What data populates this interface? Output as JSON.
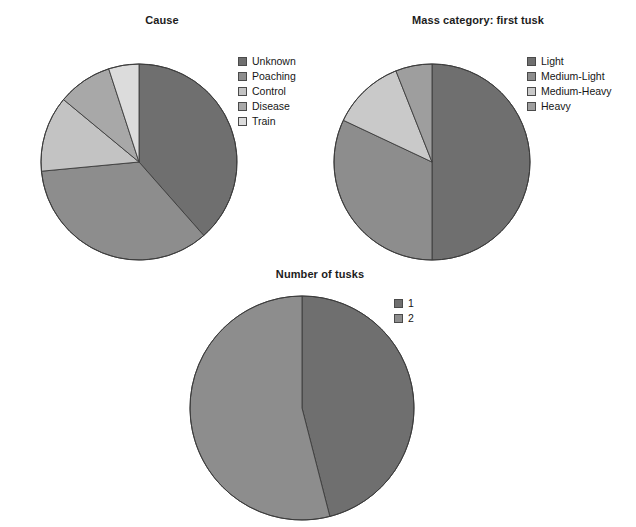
{
  "figure": {
    "background": "#ffffff",
    "width": 636,
    "height": 527
  },
  "palette": {
    "dark_gray": "#6f6f6f",
    "medium_gray": "#8d8d8d",
    "light_gray": "#c3c3c3",
    "lighter_gray": "#a8a8a8",
    "lightest_gray": "#dcdcdc",
    "outline": "#3c3c3c"
  },
  "chart_data": [
    {
      "type": "pie",
      "id": "cause",
      "title": "Cause",
      "legend_position": "right",
      "start_angle_deg": 0,
      "direction": "clockwise",
      "categories": [
        "Unknown",
        "Poaching",
        "Control",
        "Disease",
        "Train"
      ],
      "values": [
        38.5,
        35.0,
        12.5,
        9.0,
        5.0
      ],
      "unit": "percent",
      "colors": [
        "#6f6f6f",
        "#8d8d8d",
        "#c3c3c3",
        "#a8a8a8",
        "#dcdcdc"
      ]
    },
    {
      "type": "pie",
      "id": "mass-category-first-tusk",
      "title": "Mass category: first tusk",
      "legend_position": "right",
      "start_angle_deg": 0,
      "direction": "clockwise",
      "categories": [
        "Light",
        "Medium-Light",
        "Medium-Heavy",
        "Heavy"
      ],
      "values": [
        50.0,
        32.0,
        12.0,
        6.0
      ],
      "unit": "percent",
      "colors": [
        "#6f6f6f",
        "#8d8d8d",
        "#c9c9c9",
        "#9e9e9e"
      ]
    },
    {
      "type": "pie",
      "id": "number-of-tusks",
      "title": "Number of tusks",
      "legend_position": "right",
      "start_angle_deg": 0,
      "direction": "clockwise",
      "categories": [
        "1",
        "2"
      ],
      "values": [
        46.0,
        54.0
      ],
      "unit": "percent",
      "colors": [
        "#6f6f6f",
        "#8d8d8d"
      ]
    }
  ],
  "panels": {
    "cause": {
      "title": "Cause",
      "legend": [
        {
          "label": "Unknown",
          "color": "#6f6f6f"
        },
        {
          "label": "Poaching",
          "color": "#8d8d8d"
        },
        {
          "label": "Control",
          "color": "#c3c3c3"
        },
        {
          "label": "Disease",
          "color": "#a8a8a8"
        },
        {
          "label": "Train",
          "color": "#dcdcdc"
        }
      ]
    },
    "mass": {
      "title": "Mass category: first tusk",
      "legend": [
        {
          "label": "Light",
          "color": "#6f6f6f"
        },
        {
          "label": "Medium-Light",
          "color": "#8d8d8d"
        },
        {
          "label": "Medium-Heavy",
          "color": "#c9c9c9"
        },
        {
          "label": "Heavy",
          "color": "#9e9e9e"
        }
      ]
    },
    "tusks": {
      "title": "Number of tusks",
      "legend": [
        {
          "label": "1",
          "color": "#6f6f6f"
        },
        {
          "label": "2",
          "color": "#8d8d8d"
        }
      ]
    }
  }
}
